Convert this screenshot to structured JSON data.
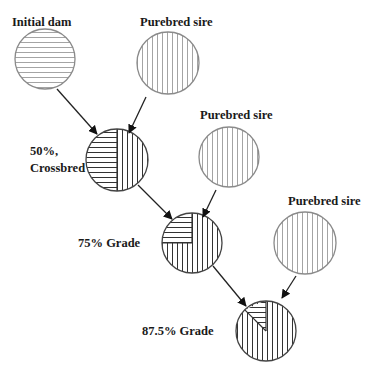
{
  "nodes": [
    {
      "id": "initial-dam",
      "label": "Initial dam",
      "pattern": "horizontal",
      "cx": 45,
      "cy": 59,
      "r": 30,
      "label_x": 12,
      "label_y": 26
    },
    {
      "id": "sire-1",
      "label": "Purebred sire",
      "pattern": "vertical",
      "cx": 168,
      "cy": 63,
      "r": 31,
      "label_x": 140,
      "label_y": 26
    },
    {
      "id": "crossbred",
      "label_line1": "50%,",
      "label_line2": "Crossbred",
      "pattern": "half",
      "purebred_fraction": 0.5,
      "cx": 117,
      "cy": 160,
      "r": 31
    },
    {
      "id": "sire-2",
      "label": "Purebred sire",
      "pattern": "vertical",
      "cx": 229,
      "cy": 157,
      "r": 30,
      "label_x": 200,
      "label_y": 119
    },
    {
      "id": "grade-75",
      "label": "75% Grade",
      "pattern": "three-quarter",
      "purebred_fraction": 0.75,
      "cx": 192,
      "cy": 243,
      "r": 30
    },
    {
      "id": "sire-3",
      "label": "Purebred sire",
      "pattern": "vertical",
      "cx": 305,
      "cy": 243,
      "r": 31,
      "label_x": 288,
      "label_y": 205
    },
    {
      "id": "grade-875",
      "label": "87.5% Grade",
      "pattern": "seven-eighths",
      "purebred_fraction": 0.875,
      "cx": 266,
      "cy": 331,
      "r": 30
    }
  ],
  "labels": {
    "initial_dam": "Initial dam",
    "sire_1": "Purebred sire",
    "sire_2": "Purebred sire",
    "sire_3": "Purebred sire",
    "crossbred_line1": "50%,",
    "crossbred_line2": "Crossbred",
    "grade_75": "75% Grade",
    "grade_875": "87.5% Grade"
  },
  "edges": [
    {
      "from": "initial-dam",
      "to": "crossbred"
    },
    {
      "from": "sire-1",
      "to": "crossbred"
    },
    {
      "from": "crossbred",
      "to": "grade-75"
    },
    {
      "from": "sire-2",
      "to": "grade-75"
    },
    {
      "from": "grade-75",
      "to": "grade-875"
    },
    {
      "from": "sire-3",
      "to": "grade-875"
    }
  ],
  "legend_meaning": {
    "horizontal_lines": "dam genetics",
    "vertical_lines": "purebred sire genetics"
  }
}
